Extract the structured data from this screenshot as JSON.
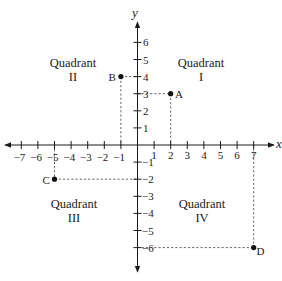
{
  "diagram": {
    "type": "coordinate-plane",
    "x_axis": {
      "name": "x",
      "ticks": [
        "−7",
        "−6",
        "−5",
        "−4",
        "−3",
        "−2",
        "−1",
        "1",
        "2",
        "3",
        "4",
        "5",
        "6",
        "7"
      ]
    },
    "y_axis": {
      "name": "y",
      "ticks_positive": [
        "1",
        "2",
        "3",
        "4",
        "5",
        "6"
      ],
      "ticks_negative": [
        "−1",
        "−2",
        "−3",
        "−4",
        "−5",
        "−6"
      ]
    },
    "quadrants": [
      {
        "title": "Quadrant",
        "numeral": "I"
      },
      {
        "title": "Quadrant",
        "numeral": "II"
      },
      {
        "title": "Quadrant",
        "numeral": "III"
      },
      {
        "title": "Quadrant",
        "numeral": "IV"
      }
    ],
    "points": [
      {
        "label": "A",
        "x": 2,
        "y": 3
      },
      {
        "label": "B",
        "x": -1,
        "y": 4
      },
      {
        "label": "C",
        "x": -5,
        "y": -2
      },
      {
        "label": "D",
        "x": 7,
        "y": -6
      }
    ],
    "colors": {
      "axis": "#1a1a1a",
      "guide": "#555555",
      "point": "#111111"
    }
  }
}
